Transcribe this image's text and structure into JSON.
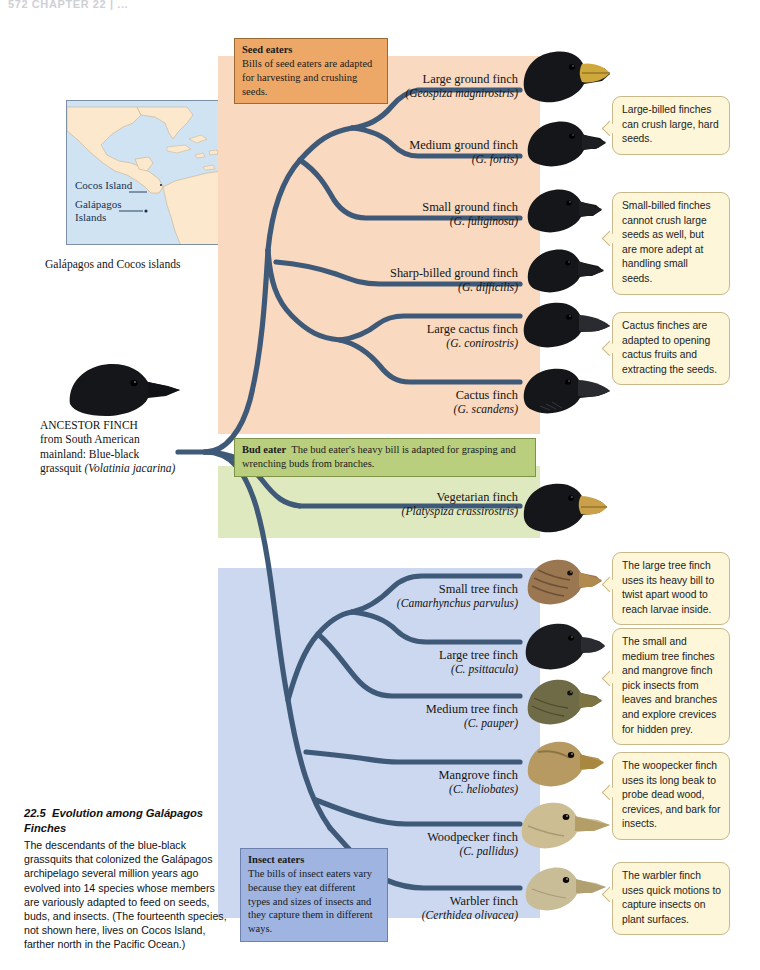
{
  "page": {
    "header": "572   CHAPTER 22  |  ...",
    "figure_number": "22.5",
    "figure_title": "Evolution among Galápagos Finches",
    "figure_caption": "The descendants of the blue-black grassquits that colonized the Galápagos archipelago several million years ago evolved into 14 species whose members are variously adapted to feed on seeds, buds, and insects. (The fourteenth species, not shown here, lives on Cocos Island, farther north in the Pacific Ocean.)"
  },
  "map": {
    "caption": "Galápagos and Cocos islands",
    "labels": [
      "Cocos Island",
      "Galápagos\nIslands"
    ],
    "ocean_color": "#cfe3f2",
    "land_color": "#fbe8cd"
  },
  "ancestor": {
    "title": "ANCESTOR FINCH",
    "line2": "from  South American",
    "line3": "mainland: Blue-black",
    "line4": "grassquit ",
    "latin": "(Volatinia jacarina)"
  },
  "diets": [
    {
      "id": "seed",
      "heading": "Seed eaters",
      "text": "Bills of seed eaters are adapted for harvesting and crushing seeds.",
      "box_color": "#eda868",
      "band_color": "#f9d9bf"
    },
    {
      "id": "bud",
      "heading": "Bud eater",
      "text": "The bud eater's heavy bill is adapted for grasping and wrenching buds from branches.",
      "box_color": "#b9cf7e",
      "band_color": "#dfe9c0"
    },
    {
      "id": "insect",
      "heading": "Insect eaters",
      "text": "The bills of insect eaters vary because they eat different types and sizes of insects and they capture them in different ways.",
      "box_color": "#9fb4e0",
      "band_color": "#ccd8f0"
    }
  ],
  "species": [
    {
      "common": "Large ground finch",
      "latin": "(Geospiza magnirostris)",
      "group": "seed",
      "beak": "#cfa83c",
      "head": "#15161a"
    },
    {
      "common": "Medium ground finch",
      "latin": "(G. fortis)",
      "group": "seed",
      "beak": "#1d1e22",
      "head": "#15161a"
    },
    {
      "common": "Small ground finch",
      "latin": "(G. fuliginosa)",
      "group": "seed",
      "beak": "#1d1e22",
      "head": "#15161a"
    },
    {
      "common": "Sharp-billed ground finch",
      "latin": "(G. difficilis)",
      "group": "seed",
      "beak": "#1d1e22",
      "head": "#15161a"
    },
    {
      "common": "Large cactus finch",
      "latin": "(G. conirostris)",
      "group": "seed",
      "beak": "#2a2b30",
      "head": "#15161a"
    },
    {
      "common": "Cactus finch",
      "latin": "(G. scandens)",
      "group": "seed",
      "beak": "#2a2b30",
      "head": "#15161a"
    },
    {
      "common": "Vegetarian finch",
      "latin": "(Platyspiza crassirostris)",
      "group": "bud",
      "beak": "#caa04a",
      "head": "#15161a"
    },
    {
      "common": "Small tree finch",
      "latin": "(Camarhynchus parvulus)",
      "group": "insect",
      "beak": "#b08a4e",
      "head": "#9a7651"
    },
    {
      "common": "Large tree finch",
      "latin": "(C. psittacula)",
      "group": "insect",
      "beak": "#2a2b30",
      "head": "#1b1c20"
    },
    {
      "common": "Medium tree finch",
      "latin": "(C. pauper)",
      "group": "insect",
      "beak": "#7d7343",
      "head": "#6e6b46"
    },
    {
      "common": "Mangrove finch",
      "latin": "(C. heliobates)",
      "group": "insect",
      "beak": "#a8883f",
      "head": "#b79a62"
    },
    {
      "common": "Woodpecker finch",
      "latin": "(C. pallidus)",
      "group": "insect",
      "beak": "#b49e68",
      "head": "#cdbd93"
    },
    {
      "common": "Warbler finch",
      "latin": "(Certhidea olivacea)",
      "group": "insect",
      "beak": "#b0a072",
      "head": "#c9bd98"
    }
  ],
  "callouts": [
    {
      "id": "large-billed",
      "text": "Large-billed finches can crush large, hard seeds."
    },
    {
      "id": "small-billed",
      "text": "Small-billed finches cannot crush large seeds as well, but are more adept at handling small seeds."
    },
    {
      "id": "cactus",
      "text": "Cactus finches are adapted to opening cactus fruits and extracting the seeds."
    },
    {
      "id": "large-tree",
      "text": "The large tree finch uses its heavy bill to twist apart wood to reach larvae inside."
    },
    {
      "id": "small-medium",
      "text": "The small and medium tree finches and mangrove finch pick insects from leaves and branches and explore crevices for hidden prey."
    },
    {
      "id": "woodpecker",
      "text": "The woopecker finch uses its long beak to probe dead wood, crevices, and bark for insects."
    },
    {
      "id": "warbler",
      "text": "The warbler finch uses quick motions to capture insects on plant surfaces."
    }
  ],
  "colors": {
    "branch": "#3f5a78",
    "callout_fill": "#fdf6d8",
    "callout_border": "#c8b98a"
  }
}
